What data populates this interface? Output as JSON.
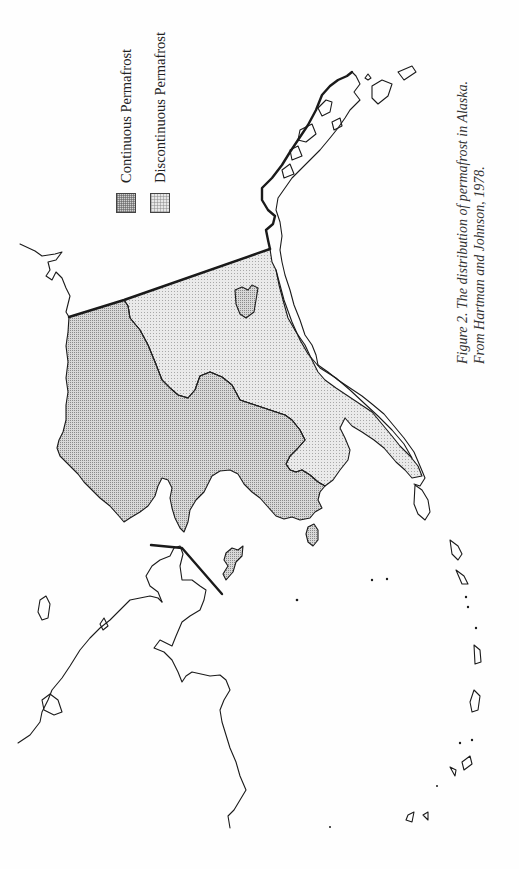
{
  "figure": {
    "title": "The distribution of permafrost in Alaska",
    "caption_line1": "Figure 2. The distribution of permafrost in Alaska.",
    "caption_line2": "From Hartman and Johnson, 1978."
  },
  "legend": {
    "items": [
      {
        "label": "Continuous Permafrost",
        "pattern": "dense-dot",
        "color": "#cfcfcf"
      },
      {
        "label": "Discontinuous Permafrost",
        "pattern": "light-dot",
        "color": "#e6e6e6"
      }
    ]
  },
  "map": {
    "region": "Alaska",
    "orientation": "rotated 90 degrees counter-clockwise",
    "zones": [
      "continuous",
      "discontinuous"
    ],
    "colors": {
      "coastline": "#1a1a1a",
      "continuous_fill": "#cfcfcf",
      "discontinuous_fill": "#e6e6e6",
      "background": "#fefefe"
    }
  }
}
